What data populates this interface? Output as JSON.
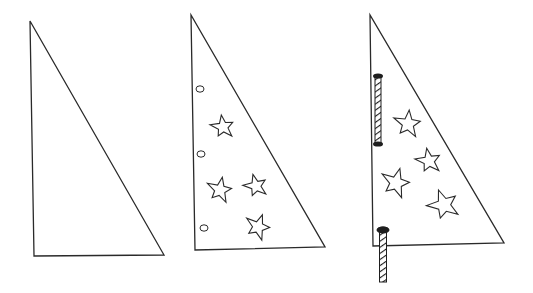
{
  "figure": {
    "description": "Three-step line illustration of making a triangular sail: plain triangle, triangle with punched holes and star decorations, and finished sail threaded onto a striped mast rod",
    "background_color": "#ffffff",
    "line_color": "#2a2a2a",
    "steps": [
      {
        "id": 1,
        "label": "plain-triangle",
        "triangle": [
          [
            30,
            21
          ],
          [
            34,
            256
          ],
          [
            164,
            255
          ]
        ],
        "holes": [],
        "stars": [],
        "rods": []
      },
      {
        "id": 2,
        "label": "triangle-with-holes-and-stars",
        "triangle": [
          [
            191,
            15
          ],
          [
            195,
            250
          ],
          [
            325,
            247
          ]
        ],
        "holes": [
          [
            200,
            89
          ],
          [
            201,
            154
          ],
          [
            204,
            228
          ]
        ],
        "stars": [
          {
            "cx": 223,
            "cy": 127,
            "r": 12,
            "rot": -8
          },
          {
            "cx": 220,
            "cy": 190,
            "r": 13,
            "rot": 10
          },
          {
            "cx": 256,
            "cy": 186,
            "r": 12,
            "rot": -15
          },
          {
            "cx": 258,
            "cy": 227,
            "r": 13,
            "rot": 20
          }
        ],
        "rods": []
      },
      {
        "id": 3,
        "label": "sail-on-mast",
        "triangle": [
          [
            370,
            15
          ],
          [
            373,
            246
          ],
          [
            504,
            243
          ]
        ],
        "holes": [],
        "stars": [
          {
            "cx": 408,
            "cy": 124,
            "r": 14,
            "rot": 5
          },
          {
            "cx": 429,
            "cy": 161,
            "r": 13,
            "rot": -10
          },
          {
            "cx": 396,
            "cy": 183,
            "r": 15,
            "rot": 15
          },
          {
            "cx": 444,
            "cy": 205,
            "r": 16,
            "rot": -20
          }
        ],
        "rods": [
          {
            "x": 378,
            "y1": 76,
            "y2": 144,
            "width": 6
          },
          {
            "x": 383,
            "y1": 229,
            "y2": 282,
            "width": 7
          }
        ]
      }
    ]
  }
}
